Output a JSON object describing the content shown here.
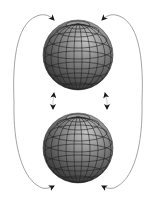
{
  "diagram": {
    "colors": {
      "background": "#ffffff",
      "sphere_dark": "#2a2a2a",
      "sphere_mid": "#6a6a6a",
      "sphere_light": "#b8b8b8",
      "grid": "#1e1e1e",
      "arrow_line": "#9a9a9a",
      "arrow_head": "#1a1a1a"
    },
    "spheres": [
      {
        "name": "top-sphere",
        "cx": 78,
        "cy": 55,
        "r": 35
      },
      {
        "name": "bottom-sphere",
        "cx": 78,
        "cy": 148,
        "r": 35
      }
    ],
    "arrows": [
      {
        "name": "left-outer-arrow-top",
        "direction": "right-down"
      },
      {
        "name": "right-outer-arrow-top",
        "direction": "left-down"
      },
      {
        "name": "left-outer-arrow-bottom",
        "direction": "right-up"
      },
      {
        "name": "right-outer-arrow-bottom",
        "direction": "left-up"
      },
      {
        "name": "left-middle-arrow-up",
        "direction": "up"
      },
      {
        "name": "left-middle-arrow-down",
        "direction": "down"
      },
      {
        "name": "right-middle-arrow-up",
        "direction": "up"
      },
      {
        "name": "right-middle-arrow-down",
        "direction": "down"
      }
    ]
  }
}
